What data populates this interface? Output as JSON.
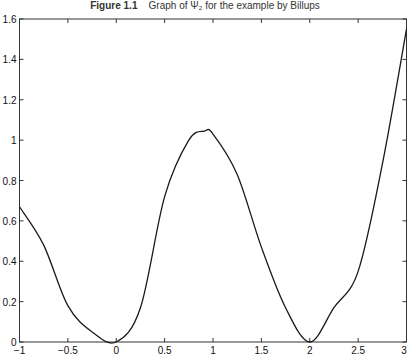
{
  "figure": {
    "caption_label": "Figure 1.1",
    "caption_text": "Graph of Ψ₂ for the example by Billups"
  },
  "chart_data": {
    "type": "line",
    "title": "Graph of Ψ₂ for the example by Billups",
    "xlabel": "",
    "ylabel": "",
    "xlim": [
      -1,
      3
    ],
    "ylim": [
      0,
      1.6
    ],
    "xticks": [
      -1,
      -0.5,
      0,
      0.5,
      1,
      1.5,
      2,
      2.5,
      3
    ],
    "xtick_labels": [
      "−1",
      "−0.5",
      "0",
      "0.5",
      "1",
      "1.5",
      "2",
      "2.5",
      "3"
    ],
    "yticks": [
      0,
      0.2,
      0.4,
      0.6,
      0.8,
      1,
      1.2,
      1.4,
      1.6
    ],
    "ytick_labels": [
      "0",
      "0.2",
      "0.4",
      "0.6",
      "0.8",
      "1",
      "1.2",
      "1.4",
      "1.6"
    ],
    "grid": false,
    "legend": null,
    "series": [
      {
        "name": "Ψ₂",
        "x": [
          -1,
          -0.75,
          -0.5,
          -0.25,
          0,
          0.25,
          0.5,
          0.75,
          0.91,
          1.0,
          1.25,
          1.5,
          1.75,
          2,
          2.25,
          2.5,
          2.75,
          3
        ],
        "y": [
          0.67,
          0.48,
          0.18,
          0.05,
          0,
          0.17,
          0.72,
          1.0,
          1.045,
          1.03,
          0.83,
          0.47,
          0.17,
          0,
          0.17,
          0.35,
          0.88,
          1.55
        ]
      }
    ]
  },
  "colors": {
    "line": "#1a1a1a",
    "axis": "#333333"
  }
}
